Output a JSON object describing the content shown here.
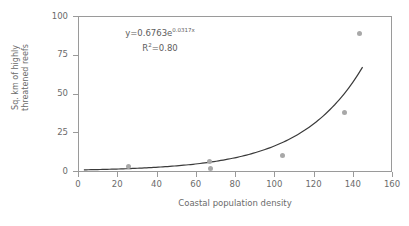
{
  "chart_data": {
    "type": "scatter",
    "title": "",
    "xlabel": "Coastal population density",
    "ylabel": "Sq. km of highly threatened reefs",
    "ylabel_line1": "Sq. km of highly",
    "ylabel_line2": "threatened reefs",
    "xlim": [
      0,
      160
    ],
    "ylim": [
      0,
      100
    ],
    "xticks": [
      0,
      20,
      40,
      60,
      80,
      100,
      120,
      140,
      160
    ],
    "yticks": [
      0,
      25,
      50,
      75,
      100
    ],
    "grid": false,
    "legend": "none",
    "marker_color": "#a8a8a8",
    "line_color": "#3a3a3a",
    "axis_color": "#9a9a9a",
    "points": [
      {
        "x": 25.5,
        "y": 3.0
      },
      {
        "x": 67.0,
        "y": 6.0
      },
      {
        "x": 67.5,
        "y": 1.8
      },
      {
        "x": 104.0,
        "y": 10.2
      },
      {
        "x": 136.0,
        "y": 37.5
      },
      {
        "x": 143.5,
        "y": 89.0
      }
    ],
    "fit": {
      "type": "exponential",
      "a": 0.6763,
      "b": 0.0317,
      "x_start": 3,
      "x_end": 145,
      "equation_prefix": "y=0.6763e",
      "equation_exponent": "0.0317x",
      "r2_prefix": "R",
      "r2_sup": "2",
      "r2_value": "=0.80"
    }
  },
  "corner_mark": ""
}
